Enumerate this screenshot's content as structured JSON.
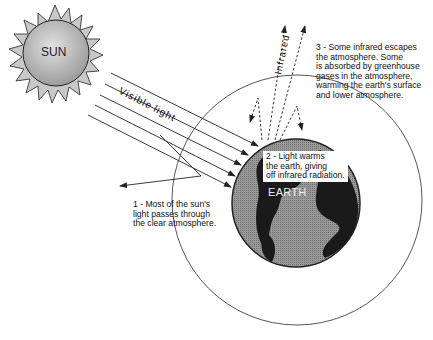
{
  "diagram": {
    "sun": {
      "label": "SUN"
    },
    "earth": {
      "label": "EARTH"
    },
    "rays": {
      "visible_label_1": "Visible",
      "visible_label_2": "light",
      "infrared_label": "Infrared"
    },
    "notes": [
      {
        "id": 1,
        "lines": [
          "1 - Most of the sun's",
          "light passes through",
          "the clear atmosphere."
        ]
      },
      {
        "id": 2,
        "lines": [
          "2 - Light warms",
          "the earth, giving",
          "off infrared radiation."
        ]
      },
      {
        "id": 3,
        "lines": [
          "3 - Some infrared escapes",
          "the atmosphere.  Some",
          "is absorbed by greenhouse",
          "gases in the atmosphere,",
          "warming the earth's surface",
          "and lower atmosphere."
        ]
      }
    ],
    "colors": {
      "line": "#222222",
      "sun_fill": "#b8b8b8",
      "earth_ocean": "#8a8a8a",
      "earth_land": "#1a1a1a",
      "background": "#ffffff"
    }
  }
}
